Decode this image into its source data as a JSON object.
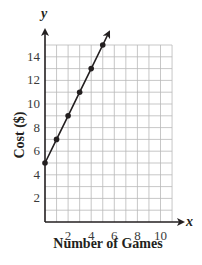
{
  "chart_data": {
    "type": "line",
    "title": "",
    "xlabel": "Number of Games",
    "ylabel": "Cost ($)",
    "x_axis_var": "x",
    "y_axis_var": "y",
    "x": [
      0,
      1,
      2,
      3,
      4,
      5
    ],
    "series": [
      {
        "name": "Cost",
        "values": [
          5,
          7,
          9,
          11,
          13,
          15
        ],
        "markers": true,
        "arrow_end": true
      }
    ],
    "xlim": [
      0,
      11
    ],
    "ylim": [
      0,
      15
    ],
    "x_ticks": [
      2,
      4,
      6,
      8,
      10
    ],
    "y_ticks": [
      2,
      4,
      6,
      8,
      10,
      12,
      14
    ],
    "grid": true,
    "grid_step": 1,
    "legend": null,
    "colors": {
      "line": "#231f20",
      "grid": "#b9b9b9",
      "text": "#231f20"
    }
  }
}
